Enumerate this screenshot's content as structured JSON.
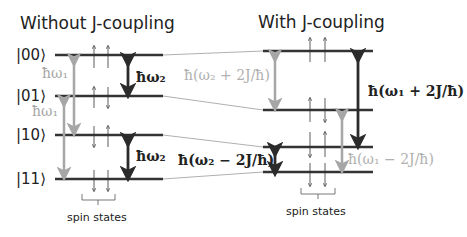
{
  "left": {
    "title": "Without J-coupling",
    "kets": [
      "|00⟩",
      "|01⟩",
      "|10⟩",
      "|11⟩"
    ],
    "labels": {
      "w1_top": "ħω₁",
      "w1_bottom": "ħω₁",
      "w2_top": "ħω₂",
      "w2_bottom": "ħω₂"
    },
    "spin_label": "spin states"
  },
  "right": {
    "title": "With J-coupling",
    "labels": {
      "w2_plus": "ħ(ω₂ + 2J/ħ)",
      "w2_minus": "ħ(ω₂ − 2J/ħ)",
      "w1_plus": "ħ(ω₁ + 2J/ħ)",
      "w1_minus": "ħ(ω₁ − 2J/ħ)"
    },
    "spin_label": "spin states"
  },
  "colors": {
    "level": "#333333",
    "dark_arrow": "#2b2b2b",
    "light_arrow": "#a6a6a6",
    "connector": "#9a9a9a"
  }
}
